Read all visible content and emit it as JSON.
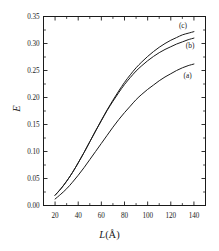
{
  "chart_data": {
    "type": "line",
    "title": "",
    "subtitle": "",
    "xlabel": "L(Å)",
    "xlabel_symbol": "L",
    "xlabel_unit": "(Å)",
    "ylabel": "E",
    "xlim": [
      10,
      150
    ],
    "ylim": [
      0.0,
      0.35
    ],
    "xticks": [
      20,
      40,
      60,
      80,
      100,
      120,
      140
    ],
    "xticklabels": [
      "20",
      "40",
      "60",
      "80",
      "100",
      "120",
      "140"
    ],
    "yticks": [
      0.0,
      0.05,
      0.1,
      0.15,
      0.2,
      0.25,
      0.3,
      0.35
    ],
    "yticklabels": [
      "0.00",
      "0.05",
      "0.10",
      "0.15",
      "0.20",
      "0.25",
      "0.30",
      "0.35"
    ],
    "xminor_ticks": [
      30,
      50,
      70,
      90,
      110,
      130,
      150
    ],
    "yminor_ticks": [
      0.025,
      0.075,
      0.125,
      0.175,
      0.225,
      0.275,
      0.325
    ],
    "grid": false,
    "legend_position": "inline-right",
    "frame": true,
    "tick_direction": "in",
    "line_color": "#1a1a1a",
    "series": [
      {
        "name": "(a)",
        "label": "(a)",
        "color": "#1a1a1a",
        "x": [
          20,
          25,
          30,
          35,
          40,
          45,
          50,
          55,
          60,
          65,
          70,
          75,
          80,
          85,
          90,
          95,
          100,
          105,
          110,
          115,
          120,
          125,
          130,
          135,
          140
        ],
        "y": [
          0.012,
          0.021,
          0.031,
          0.043,
          0.056,
          0.07,
          0.085,
          0.1,
          0.115,
          0.13,
          0.145,
          0.159,
          0.172,
          0.184,
          0.196,
          0.206,
          0.215,
          0.223,
          0.231,
          0.238,
          0.244,
          0.25,
          0.255,
          0.259,
          0.262
        ]
      },
      {
        "name": "(b)",
        "label": "(b)",
        "color": "#1a1a1a",
        "x": [
          20,
          25,
          30,
          35,
          40,
          45,
          50,
          55,
          60,
          65,
          70,
          75,
          80,
          85,
          90,
          95,
          100,
          105,
          110,
          115,
          120,
          125,
          130,
          135,
          140
        ],
        "y": [
          0.019,
          0.031,
          0.045,
          0.061,
          0.079,
          0.098,
          0.118,
          0.138,
          0.157,
          0.176,
          0.193,
          0.209,
          0.224,
          0.237,
          0.249,
          0.259,
          0.268,
          0.276,
          0.283,
          0.289,
          0.294,
          0.299,
          0.303,
          0.307,
          0.31
        ]
      },
      {
        "name": "(c)",
        "label": "(c)",
        "color": "#1a1a1a",
        "x": [
          20,
          25,
          30,
          35,
          40,
          45,
          50,
          55,
          60,
          65,
          70,
          75,
          80,
          85,
          90,
          95,
          100,
          105,
          110,
          115,
          120,
          125,
          130,
          135,
          140
        ],
        "y": [
          0.019,
          0.031,
          0.045,
          0.061,
          0.079,
          0.098,
          0.118,
          0.138,
          0.158,
          0.177,
          0.195,
          0.212,
          0.228,
          0.242,
          0.255,
          0.266,
          0.276,
          0.285,
          0.293,
          0.3,
          0.306,
          0.311,
          0.316,
          0.319,
          0.322
        ]
      }
    ],
    "annotations": [
      {
        "text": "(c)",
        "x": 127,
        "y": 0.334
      },
      {
        "text": "(b)",
        "x": 133,
        "y": 0.297
      },
      {
        "text": "(a)",
        "x": 131,
        "y": 0.241
      }
    ]
  }
}
